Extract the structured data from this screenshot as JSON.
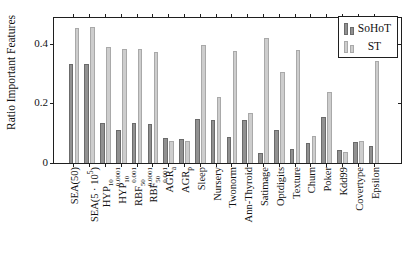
{
  "figure": {
    "background": "#ffffff",
    "axis_color": "#1f1f1f"
  },
  "legend": {
    "position": "top-right",
    "entries": [
      {
        "label": "SoHoT",
        "fill": "#919191",
        "border": "#6b6b6b"
      },
      {
        "label": "ST",
        "fill": "#cdcdcd",
        "border": "#a9a9a9"
      }
    ]
  },
  "chart_data": {
    "type": "bar",
    "title": "",
    "xlabel": "",
    "ylabel": "Ratio Important Features",
    "ylim": [
      0,
      0.49
    ],
    "grid": false,
    "legend_position": "top-right",
    "yticks": [
      {
        "value": 0,
        "label": "0"
      },
      {
        "value": 0.2,
        "label": "0.2"
      },
      {
        "value": 0.4,
        "label": "0.4"
      }
    ],
    "categories": [
      "SEA(50)",
      "SEA(5·10^5)",
      "HYP^10_0.0001",
      "HYP^10_0.001",
      "RBF^50_0.0001",
      "RBF^50_0.001",
      "AGR_a",
      "AGR_p",
      "Sleep",
      "Nursery",
      "Twonorm",
      "Ann-Thyroid",
      "Satimage",
      "Optdigits",
      "Texture",
      "Churn",
      "Poker",
      "Kdd99",
      "Covertype",
      "Epsilon"
    ],
    "category_label_segments": [
      [
        {
          "t": "SEA(50)"
        }
      ],
      [
        {
          "t": "SEA(5 · 10"
        },
        {
          "sup": "5"
        },
        {
          "t": ")"
        }
      ],
      [
        {
          "t": "HYP"
        },
        {
          "sup": "10",
          "sub": "0.0001"
        }
      ],
      [
        {
          "t": "HYP"
        },
        {
          "sup": "10",
          "sub": "0.001"
        }
      ],
      [
        {
          "t": "RBF"
        },
        {
          "sup": "50",
          "sub": "0.0001"
        }
      ],
      [
        {
          "t": "RBF"
        },
        {
          "sup": "50",
          "sub": "0.001"
        }
      ],
      [
        {
          "t": "AGR"
        },
        {
          "sub": "a"
        }
      ],
      [
        {
          "t": "AGR"
        },
        {
          "sub": "p"
        }
      ],
      [
        {
          "t": "Sleep"
        }
      ],
      [
        {
          "t": "Nursery"
        }
      ],
      [
        {
          "t": "Twonorm"
        }
      ],
      [
        {
          "t": "Ann-Thyroid"
        }
      ],
      [
        {
          "t": "Satimage"
        }
      ],
      [
        {
          "t": "Optdigits"
        }
      ],
      [
        {
          "t": "Texture"
        }
      ],
      [
        {
          "t": "Churn"
        }
      ],
      [
        {
          "t": "Poker"
        }
      ],
      [
        {
          "t": "Kdd99"
        }
      ],
      [
        {
          "t": "Covertype"
        }
      ],
      [
        {
          "t": "Epsilon"
        }
      ]
    ],
    "series": [
      {
        "name": "SoHoT",
        "fill": "#919191",
        "border": "#6b6b6b",
        "values": [
          0.335,
          0.335,
          0.135,
          0.11,
          0.135,
          0.13,
          0.085,
          0.08,
          0.147,
          0.145,
          0.087,
          0.145,
          0.035,
          0.112,
          0.047,
          0.068,
          0.155,
          0.043,
          0.07,
          0.057
        ]
      },
      {
        "name": "ST",
        "fill": "#cdcdcd",
        "border": "#a9a9a9",
        "values": [
          0.455,
          0.46,
          0.39,
          0.385,
          0.385,
          0.375,
          0.075,
          0.073,
          0.397,
          0.222,
          0.378,
          0.17,
          0.42,
          0.307,
          0.38,
          0.092,
          0.238,
          0.038,
          0.073,
          0.345
        ]
      }
    ]
  }
}
